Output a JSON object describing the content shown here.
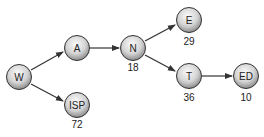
{
  "diagram": {
    "type": "directed-graph",
    "nodes": [
      {
        "id": "W",
        "label": "W",
        "value": null
      },
      {
        "id": "A",
        "label": "A",
        "value": null
      },
      {
        "id": "ISP",
        "label": "ISP",
        "value": "72"
      },
      {
        "id": "N",
        "label": "N",
        "value": "18"
      },
      {
        "id": "E",
        "label": "E",
        "value": "29"
      },
      {
        "id": "T",
        "label": "T",
        "value": "36"
      },
      {
        "id": "ED",
        "label": "ED",
        "value": "10"
      }
    ],
    "edges": [
      {
        "from": "W",
        "to": "A"
      },
      {
        "from": "W",
        "to": "ISP"
      },
      {
        "from": "A",
        "to": "N"
      },
      {
        "from": "N",
        "to": "E"
      },
      {
        "from": "N",
        "to": "T"
      },
      {
        "from": "T",
        "to": "ED"
      }
    ]
  },
  "colors": {
    "node_fill_light": "#f4f4f4",
    "node_fill_dark": "#8a8a8a",
    "stroke": "#333333"
  }
}
